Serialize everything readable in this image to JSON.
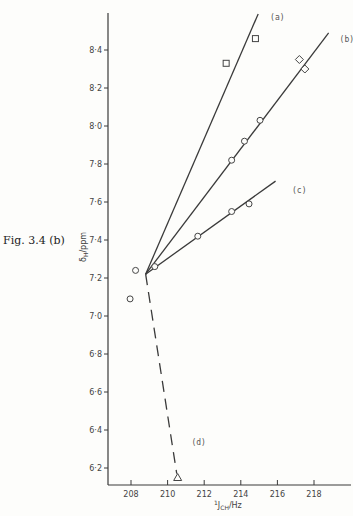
{
  "figure_label": "Fig. 3.4 (b)",
  "chart_data": {
    "type": "scatter",
    "title": "",
    "xlabel": "¹J_CH/Hz",
    "ylabel": "δ_H/ppm",
    "xlim": [
      207,
      220
    ],
    "ylim": [
      6.1,
      8.6
    ],
    "grid": false,
    "x_ticks": [
      208,
      210,
      212,
      214,
      216,
      218
    ],
    "y_ticks": [
      6.2,
      6.4,
      6.6,
      6.8,
      7.0,
      7.2,
      7.4,
      7.6,
      7.8,
      8.0,
      8.2,
      8.4
    ],
    "y_tick_labels": [
      "6·2",
      "6·4",
      "6·6",
      "6·8",
      "7·0",
      "7·2",
      "7·4",
      "7·6",
      "7·8",
      "8·0",
      "8·2",
      "8·4"
    ],
    "lines": [
      {
        "name": "(a)",
        "style": "solid",
        "from": [
          208.8,
          7.22
        ],
        "to": [
          214.95,
          8.59
        ]
      },
      {
        "name": "(b)",
        "style": "solid",
        "from": [
          208.8,
          7.22
        ],
        "to": [
          218.8,
          8.49
        ]
      },
      {
        "name": "(c)",
        "style": "solid",
        "from": [
          208.8,
          7.22
        ],
        "to": [
          215.9,
          7.71
        ]
      },
      {
        "name": "(d)",
        "style": "dashed",
        "from": [
          208.8,
          7.22
        ],
        "to": [
          210.5,
          6.17
        ]
      }
    ],
    "series": [
      {
        "name": "(a)",
        "marker": "square",
        "points": [
          [
            213.2,
            8.33
          ],
          [
            214.8,
            8.46
          ]
        ]
      },
      {
        "name": "(b)",
        "marker": "diamond",
        "points": [
          [
            217.2,
            8.35
          ],
          [
            217.5,
            8.3
          ]
        ]
      },
      {
        "name": "(b)",
        "marker": "circle",
        "points": [
          [
            213.5,
            7.82
          ],
          [
            214.2,
            7.92
          ],
          [
            215.05,
            8.03
          ]
        ]
      },
      {
        "name": "(c)",
        "marker": "circle",
        "points": [
          [
            209.3,
            7.26
          ],
          [
            211.65,
            7.42
          ],
          [
            213.5,
            7.55
          ],
          [
            214.45,
            7.59
          ]
        ]
      },
      {
        "name": "other",
        "marker": "circle",
        "points": [
          [
            208.25,
            7.24
          ],
          [
            207.95,
            7.09
          ]
        ]
      },
      {
        "name": "(d)",
        "marker": "triangle",
        "points": [
          [
            210.55,
            6.15
          ]
        ]
      }
    ],
    "annotations": [
      {
        "text": "(a)",
        "x": 215.6,
        "y": 8.56
      },
      {
        "text": "(b)",
        "x": 219.4,
        "y": 8.44
      },
      {
        "text": "(c)",
        "x": 216.8,
        "y": 7.65
      },
      {
        "text": "(d)",
        "x": 211.3,
        "y": 6.32
      }
    ]
  }
}
